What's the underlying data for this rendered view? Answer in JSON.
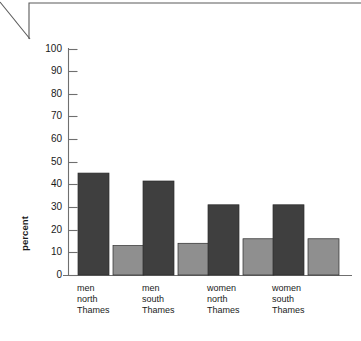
{
  "chart_data": {
    "type": "bar",
    "title": "",
    "subtitle": "",
    "xlabel": "",
    "ylabel": "percent",
    "ylim": [
      0,
      100
    ],
    "y_ticks": [
      0,
      10,
      20,
      30,
      40,
      50,
      60,
      70,
      80,
      90,
      100
    ],
    "y_tick_labels": [
      "0",
      "10",
      "20",
      "30",
      "40",
      "50",
      "60",
      "70",
      "80",
      "90",
      "100"
    ],
    "grid": false,
    "legend": "none",
    "categories": [
      {
        "lines": [
          "men",
          "north",
          "Thames"
        ]
      },
      {
        "lines": [
          "men",
          "south",
          "Thames"
        ]
      },
      {
        "lines": [
          "women",
          "north",
          "Thames"
        ]
      },
      {
        "lines": [
          "women",
          "south",
          "Thames"
        ]
      }
    ],
    "series": [
      {
        "name": "series-1",
        "color": "#3f3f3f",
        "values": [
          45,
          41.5,
          31,
          31
        ]
      },
      {
        "name": "series-2",
        "color": "#8f8f8f",
        "values": [
          13,
          14,
          16,
          16
        ]
      }
    ]
  },
  "colors": {
    "axis": "#6f6f6f",
    "text": "#1a1a1a",
    "series_dark": "#3f3f3f",
    "series_light": "#8f8f8f",
    "bar_outline": "#2b2b2b",
    "decoration": "#5a5a5a",
    "background": "#ffffff"
  },
  "decoration": {
    "name": "page-corner-rule"
  }
}
